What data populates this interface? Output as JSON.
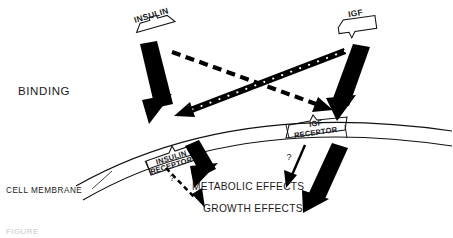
{
  "figure": {
    "stage_label": "BINDING",
    "membrane_label": "CELL MEMBRANE",
    "caption_fragment": "FIGURE",
    "background_color": "#ffffff",
    "ink_color": "#000000"
  },
  "ligands": [
    {
      "id": "insulin-ligand",
      "label": "INSULIN",
      "icon": "ligand-plug-icon",
      "x": 152,
      "y": 18
    },
    {
      "id": "igf-ligand",
      "label": "IGF",
      "icon": "ligand-plug-icon",
      "x": 356,
      "y": 16
    }
  ],
  "receptors": [
    {
      "id": "insulin-receptor",
      "line1": "INSULIN",
      "line2": "RECEPTOR",
      "x": 172,
      "y": 133
    },
    {
      "id": "igf-receptor",
      "line1": "IGF",
      "line2": "RECEPTOR",
      "x": 313,
      "y": 124
    }
  ],
  "effects": [
    {
      "id": "metabolic-effects",
      "label": "METABOLIC EFFECTS",
      "x": 192,
      "y": 190
    },
    {
      "id": "growth-effects",
      "label": "GROWTH EFFECTS",
      "x": 203,
      "y": 212
    }
  ],
  "bindings": [
    {
      "id": "insulin-to-insulin-receptor",
      "from": "insulin-ligand",
      "to": "insulin-receptor",
      "style": "solid-thick-arrow",
      "meaning": "high affinity"
    },
    {
      "id": "igf-to-igf-receptor",
      "from": "igf-ligand",
      "to": "igf-receptor",
      "style": "solid-thick-arrow",
      "meaning": "high affinity"
    },
    {
      "id": "insulin-to-igf-receptor",
      "from": "insulin-ligand",
      "to": "igf-receptor",
      "style": "dashed-arrow",
      "meaning": "low affinity cross-binding"
    },
    {
      "id": "igf-to-insulin-receptor",
      "from": "igf-ligand",
      "to": "insulin-receptor",
      "style": "beaded-dashed-arrow",
      "meaning": "low affinity cross-binding"
    }
  ],
  "signals": [
    {
      "id": "insulin-receptor-to-metabolic",
      "from": "insulin-receptor",
      "to": "metabolic-effects",
      "style": "solid-thick-arrow",
      "query": ""
    },
    {
      "id": "insulin-receptor-to-growth",
      "from": "insulin-receptor",
      "to": "growth-effects",
      "style": "thin-dashed-arrow",
      "query": "?"
    },
    {
      "id": "igf-receptor-to-metabolic",
      "from": "igf-receptor",
      "to": "metabolic-effects",
      "style": "thin-solid-arrow",
      "query": "?"
    },
    {
      "id": "igf-receptor-to-growth",
      "from": "igf-receptor",
      "to": "growth-effects",
      "style": "solid-thick-arrow",
      "query": ""
    }
  ],
  "query_marks": [
    {
      "id": "query-left",
      "label": "?",
      "x": 172,
      "y": 181
    },
    {
      "id": "query-right",
      "label": "?",
      "x": 289,
      "y": 160
    }
  ]
}
